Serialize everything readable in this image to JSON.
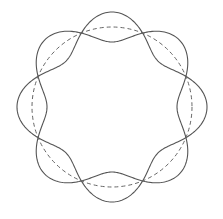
{
  "diagram": {
    "title": "",
    "center": [
      112,
      107
    ],
    "radius": 80,
    "amplitude": 15,
    "wave_number": 4,
    "node_count": 8,
    "colors": {
      "solid": "#555555",
      "dashed": "#666666",
      "background": "#ffffff"
    },
    "curves": [
      {
        "name": "wave-plus",
        "style": "solid",
        "sign": 1
      },
      {
        "name": "wave-minus",
        "style": "solid",
        "sign": -1
      },
      {
        "name": "reference-circle",
        "style": "dashed",
        "sign": 0
      }
    ]
  }
}
